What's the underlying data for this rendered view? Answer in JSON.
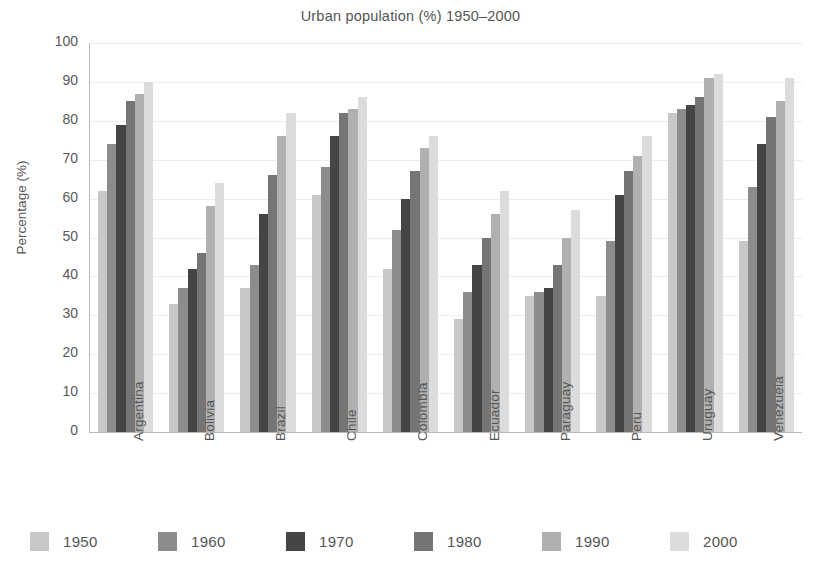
{
  "chart_data": {
    "type": "bar",
    "title": "Urban population (%) 1950–2000",
    "xlabel": "",
    "ylabel": "Percentage (%)",
    "ylim": [
      0,
      100
    ],
    "ytick_labels": [
      "100",
      "90",
      "80",
      "70",
      "60",
      "50",
      "40",
      "30",
      "20",
      "10",
      "0"
    ],
    "ytick_values": [
      100,
      90,
      80,
      70,
      60,
      50,
      40,
      30,
      20,
      10,
      0
    ],
    "grid": true,
    "legend_position": "bottom",
    "categories": [
      "Argentina",
      "Bolivia",
      "Brazil",
      "Chile",
      "Colombia",
      "Ecuador",
      "Paraguay",
      "Peru",
      "Uruguay",
      "Venezuela"
    ],
    "series": [
      {
        "name": "1950",
        "color": "#c8c8c8",
        "values": [
          62,
          33,
          37,
          61,
          42,
          29,
          35,
          35,
          82,
          49
        ]
      },
      {
        "name": "1960",
        "color": "#8c8c8c",
        "values": [
          74,
          37,
          43,
          68,
          52,
          36,
          36,
          49,
          83,
          63
        ]
      },
      {
        "name": "1970",
        "color": "#454545",
        "values": [
          79,
          42,
          56,
          76,
          60,
          43,
          37,
          61,
          84,
          74
        ]
      },
      {
        "name": "1980",
        "color": "#757575",
        "values": [
          85,
          46,
          66,
          82,
          67,
          50,
          43,
          67,
          86,
          81
        ]
      },
      {
        "name": "1990",
        "color": "#b0b0b0",
        "values": [
          87,
          58,
          76,
          83,
          73,
          56,
          50,
          71,
          91,
          85
        ]
      },
      {
        "name": "2000",
        "color": "#dcdcdc",
        "values": [
          90,
          64,
          82,
          86,
          76,
          62,
          57,
          76,
          92,
          91
        ]
      }
    ]
  },
  "axis": {
    "y_label": "Percentage (%)"
  }
}
